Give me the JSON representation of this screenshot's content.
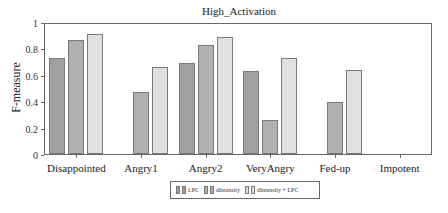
{
  "chart_data": {
    "type": "bar",
    "title": "High_Activation",
    "xlabel": "",
    "ylabel": "F-measure",
    "ylim": [
      0,
      1
    ],
    "yticks": [
      "0",
      "0.2",
      "0.4",
      "0.6",
      "0.8",
      "1"
    ],
    "grid": false,
    "legend_position": "bottom",
    "categories": [
      "Disappointed",
      "Angry1",
      "Angry2",
      "VeryAngry",
      "Fed-up",
      "Impotent"
    ],
    "series": [
      {
        "name": "LPC",
        "color": "#a0a0a0",
        "values": [
          0.74,
          0.0,
          0.7,
          0.64,
          0.0,
          0.0
        ]
      },
      {
        "name": "dIntensity",
        "color": "#b0b0b0",
        "values": [
          0.88,
          0.48,
          0.84,
          0.26,
          0.4,
          0.0
        ]
      },
      {
        "name": "dIntensity + LPC",
        "color": "#e0e0e0",
        "values": [
          0.92,
          0.67,
          0.9,
          0.74,
          0.65,
          0.0
        ]
      }
    ]
  }
}
